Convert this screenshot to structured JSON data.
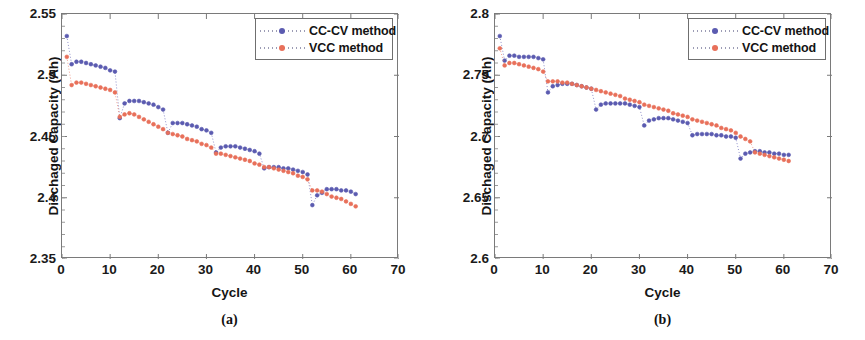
{
  "figure": {
    "panels": [
      {
        "id": "a",
        "caption": "(a)",
        "xlabel": "Cycle",
        "ylabel": "Dischaged Capacity (Ah)",
        "xticks": [
          "0",
          "10",
          "20",
          "30",
          "40",
          "50",
          "60",
          "70"
        ],
        "yticks": [
          "2.35",
          "2.4",
          "2.45",
          "2.5",
          "2.55"
        ],
        "legend": [
          {
            "label": "CC-CV method",
            "color": "#5b5bb0",
            "marker": "circle"
          },
          {
            "label": "VCC method",
            "color": "#e8705a",
            "marker": "triangle"
          }
        ]
      },
      {
        "id": "b",
        "caption": "(b)",
        "xlabel": "Cycle",
        "ylabel": "Dischaged Capacity (Ah)",
        "xticks": [
          "0",
          "10",
          "20",
          "30",
          "40",
          "50",
          "60",
          "70"
        ],
        "yticks": [
          "2.6",
          "2.65",
          "2.7",
          "2.75",
          "2.8"
        ],
        "legend": [
          {
            "label": "CC-CV method",
            "color": "#5b5bb0",
            "marker": "circle"
          },
          {
            "label": "VCC method",
            "color": "#e8705a",
            "marker": "triangle"
          }
        ]
      }
    ]
  },
  "chart_data": [
    {
      "type": "scatter",
      "panel": "a",
      "title": "",
      "xlabel": "Cycle",
      "ylabel": "Dischaged Capacity (Ah)",
      "xlim": [
        0,
        70
      ],
      "ylim": [
        2.35,
        2.55
      ],
      "xticks": [
        0,
        10,
        20,
        30,
        40,
        50,
        60,
        70
      ],
      "yticks": [
        2.35,
        2.4,
        2.45,
        2.5,
        2.55
      ],
      "grid": false,
      "legend_position": "top-right",
      "x": [
        1,
        2,
        3,
        4,
        5,
        6,
        7,
        8,
        9,
        10,
        11,
        12,
        13,
        14,
        15,
        16,
        17,
        18,
        19,
        20,
        21,
        22,
        23,
        24,
        25,
        26,
        27,
        28,
        29,
        30,
        31,
        32,
        33,
        34,
        35,
        36,
        37,
        38,
        39,
        40,
        41,
        42,
        43,
        44,
        45,
        46,
        47,
        48,
        49,
        50,
        51,
        52,
        53,
        54,
        55,
        56,
        57,
        58,
        59,
        60,
        61
      ],
      "series": [
        {
          "name": "CC-CV method",
          "color": "#5b5bb0",
          "values": [
            2.532,
            2.509,
            2.511,
            2.511,
            2.51,
            2.509,
            2.508,
            2.507,
            2.506,
            2.504,
            2.503,
            2.465,
            2.477,
            2.479,
            2.479,
            2.479,
            2.478,
            2.477,
            2.476,
            2.474,
            2.472,
            2.453,
            2.461,
            2.461,
            2.461,
            2.46,
            2.459,
            2.458,
            2.456,
            2.455,
            2.453,
            2.437,
            2.441,
            2.442,
            2.442,
            2.442,
            2.441,
            2.44,
            2.439,
            2.438,
            2.436,
            2.424,
            2.425,
            2.425,
            2.425,
            2.424,
            2.424,
            2.423,
            2.422,
            2.421,
            2.419,
            2.394,
            2.402,
            2.404,
            2.407,
            2.407,
            2.407,
            2.406,
            2.406,
            2.405,
            2.403
          ]
        },
        {
          "name": "VCC method",
          "color": "#e8705a",
          "values": [
            2.515,
            2.492,
            2.494,
            2.494,
            2.493,
            2.492,
            2.491,
            2.49,
            2.489,
            2.488,
            2.486,
            2.466,
            2.468,
            2.469,
            2.468,
            2.466,
            2.464,
            2.462,
            2.46,
            2.458,
            2.456,
            2.453,
            2.452,
            2.451,
            2.45,
            2.448,
            2.447,
            2.446,
            2.444,
            2.443,
            2.441,
            2.436,
            2.436,
            2.435,
            2.434,
            2.433,
            2.432,
            2.431,
            2.43,
            2.428,
            2.427,
            2.425,
            2.425,
            2.424,
            2.423,
            2.422,
            2.421,
            2.42,
            2.418,
            2.417,
            2.415,
            2.406,
            2.406,
            2.405,
            2.403,
            2.401,
            2.4,
            2.399,
            2.397,
            2.395,
            2.393
          ]
        }
      ]
    },
    {
      "type": "scatter",
      "panel": "b",
      "title": "",
      "xlabel": "Cycle",
      "ylabel": "Dischaged Capacity (Ah)",
      "xlim": [
        0,
        70
      ],
      "ylim": [
        2.6,
        2.8
      ],
      "xticks": [
        0,
        10,
        20,
        30,
        40,
        50,
        60,
        70
      ],
      "yticks": [
        2.6,
        2.65,
        2.7,
        2.75,
        2.8
      ],
      "grid": false,
      "legend_position": "top-right",
      "x": [
        1,
        2,
        3,
        4,
        5,
        6,
        7,
        8,
        9,
        10,
        11,
        12,
        13,
        14,
        15,
        16,
        17,
        18,
        19,
        20,
        21,
        22,
        23,
        24,
        25,
        26,
        27,
        28,
        29,
        30,
        31,
        32,
        33,
        34,
        35,
        36,
        37,
        38,
        39,
        40,
        41,
        42,
        43,
        44,
        45,
        46,
        47,
        48,
        49,
        50,
        51,
        52,
        53,
        54,
        55,
        56,
        57,
        58,
        59,
        60,
        61
      ],
      "series": [
        {
          "name": "CC-CV method",
          "color": "#5b5bb0",
          "values": [
            2.782,
            2.762,
            2.766,
            2.766,
            2.765,
            2.765,
            2.765,
            2.765,
            2.764,
            2.763,
            2.736,
            2.741,
            2.742,
            2.743,
            2.743,
            2.743,
            2.742,
            2.741,
            2.74,
            2.739,
            2.722,
            2.726,
            2.727,
            2.727,
            2.727,
            2.727,
            2.727,
            2.726,
            2.725,
            2.724,
            2.709,
            2.713,
            2.714,
            2.715,
            2.715,
            2.715,
            2.714,
            2.713,
            2.712,
            2.711,
            2.701,
            2.702,
            2.702,
            2.702,
            2.702,
            2.701,
            2.701,
            2.7,
            2.7,
            2.699,
            2.682,
            2.686,
            2.687,
            2.688,
            2.688,
            2.687,
            2.687,
            2.686,
            2.686,
            2.685,
            2.685
          ]
        },
        {
          "name": "VCC method",
          "color": "#e8705a",
          "values": [
            2.772,
            2.758,
            2.76,
            2.76,
            2.759,
            2.758,
            2.757,
            2.756,
            2.755,
            2.753,
            2.745,
            2.745,
            2.745,
            2.744,
            2.744,
            2.743,
            2.742,
            2.741,
            2.74,
            2.739,
            2.738,
            2.737,
            2.736,
            2.735,
            2.734,
            2.733,
            2.731,
            2.73,
            2.729,
            2.728,
            2.726,
            2.725,
            2.724,
            2.723,
            2.722,
            2.721,
            2.719,
            2.718,
            2.717,
            2.716,
            2.714,
            2.713,
            2.712,
            2.711,
            2.71,
            2.709,
            2.707,
            2.706,
            2.705,
            2.703,
            2.7,
            2.698,
            2.696,
            2.687,
            2.686,
            2.685,
            2.684,
            2.683,
            2.682,
            2.681,
            2.68
          ]
        }
      ]
    }
  ]
}
